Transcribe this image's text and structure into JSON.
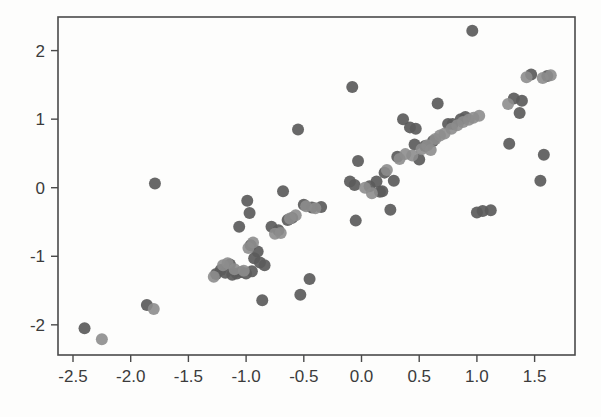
{
  "figure": {
    "background_color": "#fdfdfc",
    "frame_color": "#4a4a4a",
    "title": "",
    "width": 601,
    "height": 417
  },
  "axes": {
    "x_tick_labels": [
      "-2.5",
      "-2.0",
      "-1.5",
      "-1.0",
      "-0.5",
      "0.0",
      "0.5",
      "1.0",
      "1.5"
    ],
    "y_tick_labels": [
      "2",
      "1",
      "0",
      "-1",
      "-2"
    ],
    "x_tick_values": [
      -2.5,
      -2.0,
      -1.5,
      -1.0,
      -0.5,
      0.0,
      0.5,
      1.0,
      1.5
    ],
    "y_tick_values": [
      2,
      1,
      0,
      -1,
      -2
    ],
    "xlim": [
      -2.63,
      1.85
    ],
    "ylim": [
      -2.44,
      2.49
    ]
  },
  "chart_data": {
    "type": "scatter",
    "title": "",
    "xlabel": "",
    "ylabel": "",
    "xlim": [
      -2.63,
      1.85
    ],
    "ylim": [
      -2.44,
      2.49
    ],
    "grid": false,
    "legend": "none",
    "marker_size_px": 12,
    "series": [
      {
        "name": "dark-series",
        "color": "#5b5b5b",
        "opacity": 0.92,
        "points": [
          [
            -2.4,
            -2.05
          ],
          [
            -1.86,
            -1.71
          ],
          [
            -1.79,
            0.06
          ],
          [
            -1.26,
            -1.26
          ],
          [
            -1.22,
            -1.2
          ],
          [
            -1.18,
            -1.24
          ],
          [
            -1.14,
            -1.12
          ],
          [
            -1.12,
            -1.27
          ],
          [
            -1.08,
            -1.25
          ],
          [
            -1.06,
            -0.57
          ],
          [
            -1.04,
            -1.23
          ],
          [
            -1.0,
            -1.25
          ],
          [
            -0.99,
            -0.19
          ],
          [
            -0.97,
            -0.37
          ],
          [
            -0.96,
            -0.84
          ],
          [
            -0.95,
            -1.22
          ],
          [
            -0.93,
            -1.03
          ],
          [
            -0.9,
            -0.93
          ],
          [
            -0.88,
            -1.09
          ],
          [
            -0.86,
            -1.64
          ],
          [
            -0.84,
            -1.13
          ],
          [
            -0.78,
            -0.57
          ],
          [
            -0.72,
            -0.62
          ],
          [
            -0.68,
            -0.05
          ],
          [
            -0.64,
            -0.47
          ],
          [
            -0.6,
            -0.44
          ],
          [
            -0.55,
            0.85
          ],
          [
            -0.53,
            -1.56
          ],
          [
            -0.5,
            -0.25
          ],
          [
            -0.45,
            -1.33
          ],
          [
            -0.43,
            -0.29
          ],
          [
            -0.35,
            -0.28
          ],
          [
            -0.1,
            0.09
          ],
          [
            -0.08,
            1.47
          ],
          [
            -0.06,
            0.04
          ],
          [
            -0.05,
            -0.48
          ],
          [
            -0.03,
            0.39
          ],
          [
            0.07,
            0.02
          ],
          [
            0.13,
            0.09
          ],
          [
            0.16,
            -0.06
          ],
          [
            0.18,
            -0.05
          ],
          [
            0.2,
            0.22
          ],
          [
            0.25,
            -0.32
          ],
          [
            0.28,
            0.1
          ],
          [
            0.31,
            0.45
          ],
          [
            0.36,
            1.0
          ],
          [
            0.42,
            0.88
          ],
          [
            0.46,
            0.63
          ],
          [
            0.47,
            0.86
          ],
          [
            0.5,
            0.41
          ],
          [
            0.55,
            0.61
          ],
          [
            0.62,
            0.68
          ],
          [
            0.66,
            1.23
          ],
          [
            0.75,
            0.93
          ],
          [
            0.79,
            0.93
          ],
          [
            0.86,
            1.0
          ],
          [
            0.9,
            1.03
          ],
          [
            0.96,
            2.29
          ],
          [
            1.0,
            -0.36
          ],
          [
            1.05,
            -0.34
          ],
          [
            1.12,
            -0.33
          ],
          [
            1.28,
            0.64
          ],
          [
            1.32,
            1.3
          ],
          [
            1.37,
            1.09
          ],
          [
            1.39,
            1.27
          ],
          [
            1.47,
            1.65
          ],
          [
            1.55,
            0.1
          ],
          [
            1.58,
            0.48
          ],
          [
            1.61,
            1.63
          ]
        ]
      },
      {
        "name": "light-series",
        "color": "#8d8d8d",
        "opacity": 0.9,
        "points": [
          [
            -2.25,
            -2.21
          ],
          [
            -1.8,
            -1.77
          ],
          [
            -1.28,
            -1.3
          ],
          [
            -1.2,
            -1.13
          ],
          [
            -1.16,
            -1.1
          ],
          [
            -1.1,
            -1.19
          ],
          [
            -1.02,
            -1.21
          ],
          [
            -0.98,
            -0.88
          ],
          [
            -0.94,
            -0.8
          ],
          [
            -0.75,
            -0.67
          ],
          [
            -0.7,
            -0.66
          ],
          [
            -0.62,
            -0.45
          ],
          [
            -0.57,
            -0.4
          ],
          [
            -0.48,
            -0.27
          ],
          [
            -0.4,
            -0.3
          ],
          [
            0.03,
            0.0
          ],
          [
            0.09,
            -0.08
          ],
          [
            0.22,
            0.26
          ],
          [
            0.33,
            0.42
          ],
          [
            0.38,
            0.49
          ],
          [
            0.44,
            0.47
          ],
          [
            0.52,
            0.56
          ],
          [
            0.57,
            0.62
          ],
          [
            0.6,
            0.55
          ],
          [
            0.64,
            0.71
          ],
          [
            0.68,
            0.76
          ],
          [
            0.72,
            0.79
          ],
          [
            0.78,
            0.86
          ],
          [
            0.83,
            0.91
          ],
          [
            0.88,
            0.96
          ],
          [
            0.93,
            0.99
          ],
          [
            0.97,
            1.02
          ],
          [
            1.02,
            1.05
          ],
          [
            1.27,
            1.22
          ],
          [
            1.43,
            1.61
          ],
          [
            1.57,
            1.6
          ],
          [
            1.64,
            1.64
          ]
        ]
      }
    ]
  }
}
